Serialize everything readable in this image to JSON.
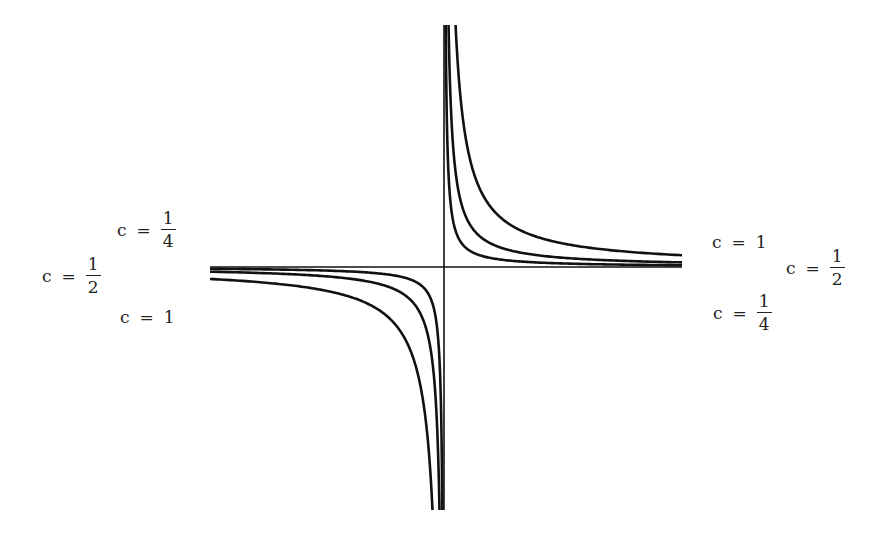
{
  "figure": {
    "colors": {
      "curve": "#111111",
      "axis": "#111111",
      "text": "#222222"
    },
    "origin": [
      444,
      267
    ],
    "x_extent": [
      210,
      682
    ],
    "y_extent": [
      25,
      510
    ],
    "curves": [
      {
        "c": "1",
        "k": 2800
      },
      {
        "c": "1/2",
        "k": 1100
      },
      {
        "c": "1/4",
        "k": 420
      }
    ]
  },
  "labels": {
    "left": [
      {
        "var": "c",
        "eq": "=",
        "num": "1",
        "den": "4",
        "x": 117,
        "y": 217
      },
      {
        "var": "c",
        "eq": "=",
        "num": "1",
        "den": "2",
        "x": 42,
        "y": 262
      },
      {
        "var": "c",
        "eq": "=",
        "value": "1",
        "x": 120,
        "y": 308
      }
    ],
    "right": [
      {
        "var": "c",
        "eq": "=",
        "value": "1",
        "x": 712,
        "y": 233
      },
      {
        "var": "c",
        "eq": "=",
        "num": "1",
        "den": "2",
        "x": 786,
        "y": 256
      },
      {
        "var": "c",
        "eq": "=",
        "num": "1",
        "den": "4",
        "x": 713,
        "y": 300
      }
    ]
  }
}
